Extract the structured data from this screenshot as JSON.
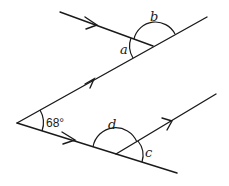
{
  "diagram": {
    "type": "geometry-parallel-lines-angles",
    "given_angle": "68°",
    "angle_labels": {
      "a": "a",
      "b": "b",
      "c": "c",
      "d": "d"
    },
    "parallel_marks": "single arrows on parallel lines"
  }
}
